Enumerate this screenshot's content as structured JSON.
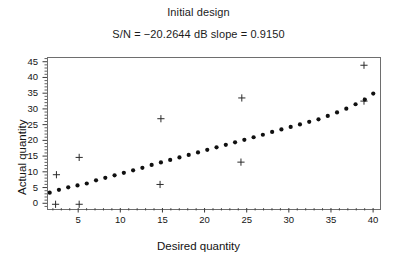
{
  "chart_data": {
    "type": "scatter",
    "title": "Initial design",
    "subtitle": "S/N = −20.2644 dB    slope = 0.9150",
    "xlabel": "Desired quantity",
    "ylabel": "Actual quantity",
    "xlim": [
      1.3,
      40.7
    ],
    "ylim": [
      -1.5,
      46.5
    ],
    "xticks": [
      5,
      10,
      15,
      20,
      25,
      30,
      35,
      40
    ],
    "yticks": [
      0,
      5,
      10,
      15,
      20,
      25,
      30,
      35,
      40,
      45
    ],
    "xtick_labels": [
      "5",
      "10",
      "15",
      "20",
      "25",
      "30",
      "35",
      "40"
    ],
    "ytick_labels": [
      "0",
      "5",
      "10",
      "15",
      "20",
      "25",
      "30",
      "35",
      "40",
      "45"
    ],
    "minor_ticks": true,
    "grid": false,
    "legend": "none",
    "series": [
      {
        "name": "measured",
        "marker": "plus",
        "color": "#2b2b2b",
        "points": [
          [
            2.2,
            0.0
          ],
          [
            5.0,
            0.0
          ],
          [
            2.3,
            9.4
          ],
          [
            5.0,
            14.9
          ],
          [
            14.7,
            27.2
          ],
          [
            14.6,
            6.3
          ],
          [
            24.3,
            33.8
          ],
          [
            24.2,
            13.4
          ],
          [
            38.8,
            44.2
          ],
          [
            38.8,
            32.8
          ]
        ]
      },
      {
        "name": "fitted",
        "marker": "dot",
        "color": "#101010",
        "points": [
          [
            1.5,
            3.7
          ],
          [
            2.6,
            4.6
          ],
          [
            3.7,
            5.4
          ],
          [
            4.8,
            6.0
          ],
          [
            5.9,
            6.6
          ],
          [
            7.0,
            7.6
          ],
          [
            8.1,
            8.4
          ],
          [
            9.2,
            9.2
          ],
          [
            10.3,
            10.0
          ],
          [
            11.4,
            10.8
          ],
          [
            12.5,
            11.6
          ],
          [
            13.6,
            12.5
          ],
          [
            14.7,
            13.3
          ],
          [
            15.8,
            14.1
          ],
          [
            16.9,
            14.9
          ],
          [
            18.0,
            15.7
          ],
          [
            19.1,
            16.5
          ],
          [
            20.2,
            17.3
          ],
          [
            21.3,
            18.1
          ],
          [
            22.4,
            18.9
          ],
          [
            23.5,
            19.7
          ],
          [
            24.6,
            20.5
          ],
          [
            25.7,
            21.3
          ],
          [
            26.8,
            22.1
          ],
          [
            27.9,
            23.0
          ],
          [
            29.0,
            23.8
          ],
          [
            30.1,
            24.6
          ],
          [
            31.2,
            25.4
          ],
          [
            32.3,
            26.2
          ],
          [
            33.4,
            27.0
          ],
          [
            34.5,
            28.1
          ],
          [
            35.6,
            29.2
          ],
          [
            36.7,
            30.4
          ],
          [
            37.8,
            31.8
          ],
          [
            38.9,
            33.3
          ],
          [
            39.9,
            35.2
          ]
        ]
      }
    ]
  }
}
